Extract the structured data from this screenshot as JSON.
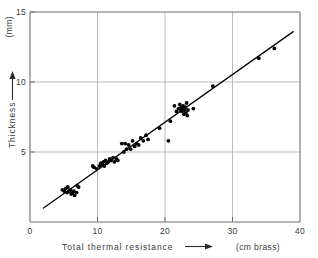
{
  "chart_data": {
    "type": "scatter",
    "title": "",
    "xlabel": "Total thermal resistance",
    "xunit": "(cm brass)",
    "ylabel": "Thickness",
    "yunit": "(mm)",
    "xlim": [
      0,
      40
    ],
    "ylim": [
      0,
      15
    ],
    "xticks": [
      0,
      10,
      20,
      30,
      40
    ],
    "yticks": [
      5,
      10,
      15
    ],
    "xtick_labels": [
      "0",
      "10",
      "20",
      "30",
      "40"
    ],
    "ytick_labels": [
      "5",
      "10",
      "15"
    ],
    "grid": true,
    "grid_axes": "both",
    "legend": "none",
    "x_arrow": true,
    "y_arrow": true,
    "series": [
      {
        "name": "measurements",
        "marker": "filled-circle",
        "color": "#050505",
        "points": [
          [
            4.8,
            2.3
          ],
          [
            5.1,
            2.2
          ],
          [
            5.3,
            2.4
          ],
          [
            5.5,
            2.1
          ],
          [
            5.6,
            2.5
          ],
          [
            5.8,
            2.2
          ],
          [
            6.0,
            2.3
          ],
          [
            6.1,
            2.0
          ],
          [
            6.3,
            2.1
          ],
          [
            6.5,
            2.2
          ],
          [
            6.6,
            1.9
          ],
          [
            6.9,
            2.1
          ],
          [
            7.0,
            2.6
          ],
          [
            7.2,
            2.5
          ],
          [
            9.3,
            4.0
          ],
          [
            9.5,
            3.9
          ],
          [
            9.9,
            3.8
          ],
          [
            10.3,
            4.0
          ],
          [
            10.5,
            4.2
          ],
          [
            10.7,
            4.1
          ],
          [
            10.9,
            4.3
          ],
          [
            11.0,
            4.0
          ],
          [
            11.2,
            4.4
          ],
          [
            11.4,
            4.2
          ],
          [
            11.6,
            4.3
          ],
          [
            11.8,
            4.5
          ],
          [
            12.0,
            4.4
          ],
          [
            12.3,
            4.6
          ],
          [
            12.5,
            4.3
          ],
          [
            12.8,
            4.5
          ],
          [
            13.0,
            4.4
          ],
          [
            13.6,
            5.6
          ],
          [
            13.9,
            5.0
          ],
          [
            14.1,
            5.6
          ],
          [
            14.3,
            5.2
          ],
          [
            14.6,
            5.5
          ],
          [
            14.9,
            5.2
          ],
          [
            15.2,
            5.8
          ],
          [
            15.5,
            5.4
          ],
          [
            15.8,
            5.6
          ],
          [
            16.1,
            5.5
          ],
          [
            16.4,
            6.0
          ],
          [
            16.8,
            5.8
          ],
          [
            17.2,
            6.2
          ],
          [
            17.5,
            5.9
          ],
          [
            19.2,
            6.7
          ],
          [
            20.5,
            5.8
          ],
          [
            20.8,
            7.2
          ],
          [
            21.4,
            8.3
          ],
          [
            21.7,
            7.9
          ],
          [
            22.0,
            8.1
          ],
          [
            22.2,
            8.4
          ],
          [
            22.3,
            8.0
          ],
          [
            22.4,
            8.2
          ],
          [
            22.5,
            7.9
          ],
          [
            22.6,
            8.1
          ],
          [
            22.7,
            8.3
          ],
          [
            22.8,
            7.7
          ],
          [
            22.9,
            8.0
          ],
          [
            23.0,
            8.2
          ],
          [
            23.1,
            7.8
          ],
          [
            23.2,
            8.5
          ],
          [
            23.3,
            7.6
          ],
          [
            23.4,
            8.0
          ],
          [
            24.2,
            8.1
          ],
          [
            27.1,
            9.7
          ],
          [
            33.9,
            11.7
          ],
          [
            36.2,
            12.4
          ]
        ]
      }
    ],
    "fit_line": {
      "name": "regression-line",
      "color": "#000000",
      "x_start": 2.0,
      "y_start": 1.0,
      "x_end": 39.0,
      "y_end": 13.6
    }
  }
}
